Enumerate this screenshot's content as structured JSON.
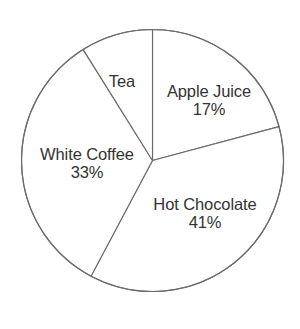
{
  "chart_data": {
    "type": "pie",
    "title": "",
    "subtitle": "",
    "xlabel": "",
    "ylabel": "",
    "grid": false,
    "legend_position": "none",
    "label_mode": "inside-slice",
    "units": "percent",
    "categories": [
      "Apple Juice",
      "Hot Chocolate",
      "White Coffee",
      "Tea"
    ],
    "values": [
      17,
      41,
      33,
      9
    ],
    "slices": [
      {
        "name": "Apple Juice",
        "value": 17,
        "value_label": "17%",
        "value_shown": true,
        "start_angle_deg": 0,
        "end_angle_deg": 75,
        "fill": "#ffffff",
        "stroke": "#6b6b6b"
      },
      {
        "name": "Hot Chocolate",
        "value": 41,
        "value_label": "41%",
        "value_shown": true,
        "start_angle_deg": 75,
        "end_angle_deg": 208,
        "fill": "#ffffff",
        "stroke": "#6b6b6b"
      },
      {
        "name": "White Coffee",
        "value": 33,
        "value_label": "33%",
        "value_shown": true,
        "start_angle_deg": 208,
        "end_angle_deg": 328,
        "fill": "#ffffff",
        "stroke": "#6b6b6b"
      },
      {
        "name": "Tea",
        "value": 9,
        "value_label": "",
        "value_shown": false,
        "start_angle_deg": 328,
        "end_angle_deg": 360,
        "fill": "#ffffff",
        "stroke": "#6b6b6b"
      }
    ]
  },
  "geometry": {
    "center_x": 152.5,
    "center_y": 160.5,
    "radius": 131
  },
  "style": {
    "background": "#ffffff",
    "stroke_color": "#6b6b6b",
    "text_color": "#333333"
  }
}
